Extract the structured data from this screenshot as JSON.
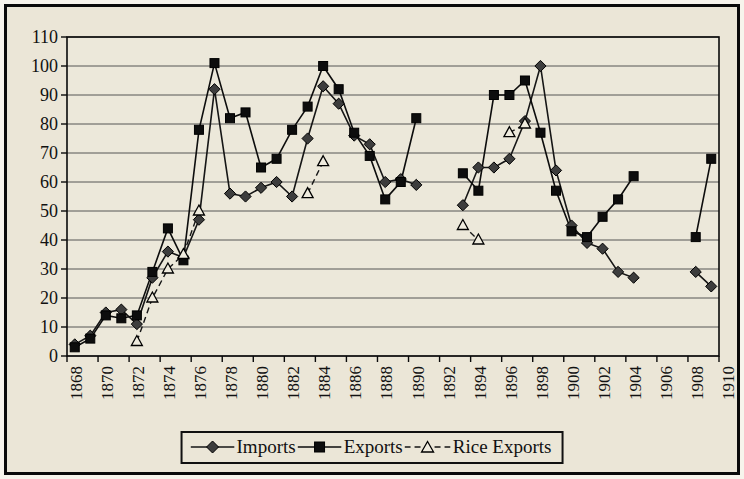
{
  "frame": {
    "page_background": "#f7f4ec",
    "paper_background": "#ebe6d7",
    "border_color": "#0a0a0a"
  },
  "chart_data": {
    "type": "line",
    "title": "",
    "xlabel": "",
    "ylabel": "",
    "ylim": [
      0,
      110
    ],
    "yticks": [
      0,
      10,
      20,
      30,
      40,
      50,
      60,
      70,
      80,
      90,
      100,
      110
    ],
    "xtick_labels": [
      "1868",
      "1870",
      "1872",
      "1874",
      "1876",
      "1878",
      "1880",
      "1882",
      "1884",
      "1886",
      "1888",
      "1890",
      "1892",
      "1894",
      "1896",
      "1898",
      "1900",
      "1902",
      "1904",
      "1906",
      "1908",
      "1910"
    ],
    "years": [
      1868,
      1869,
      1870,
      1871,
      1872,
      1873,
      1874,
      1875,
      1876,
      1877,
      1878,
      1879,
      1880,
      1881,
      1882,
      1883,
      1884,
      1885,
      1886,
      1887,
      1888,
      1889,
      1890,
      1891,
      1892,
      1893,
      1894,
      1895,
      1896,
      1897,
      1898,
      1899,
      1900,
      1901,
      1902,
      1903,
      1904,
      1905,
      1906,
      1907,
      1908,
      1909,
      1910
    ],
    "grid": "horizontal",
    "legend_position": "bottom",
    "plot": {
      "bg": "#ece8da",
      "grid_color": "#454545",
      "axis_color": "#0a0a0a",
      "tick_font_px": 18
    },
    "series": [
      {
        "name": "Imports",
        "marker": "diamond",
        "line_style": "solid",
        "color": "#161616",
        "marker_fill": "#3d3d3d",
        "values": [
          4,
          7,
          15,
          16,
          11,
          27,
          36,
          34,
          47,
          92,
          56,
          55,
          58,
          60,
          55,
          75,
          93,
          87,
          76,
          73,
          60,
          61,
          59,
          null,
          null,
          52,
          65,
          65,
          68,
          81,
          100,
          64,
          45,
          39,
          37,
          29,
          27,
          null,
          null,
          null,
          29,
          24,
          null
        ]
      },
      {
        "name": "Exports",
        "marker": "square",
        "line_style": "solid",
        "color": "#0d0d0d",
        "marker_fill": "#0d0d0d",
        "values": [
          3,
          6,
          14,
          13,
          14,
          29,
          44,
          33,
          78,
          101,
          82,
          84,
          65,
          68,
          78,
          86,
          100,
          92,
          77,
          69,
          54,
          60,
          82,
          null,
          null,
          63,
          57,
          90,
          90,
          95,
          77,
          57,
          43,
          41,
          48,
          54,
          62,
          null,
          null,
          null,
          41,
          68,
          null
        ]
      },
      {
        "name": "Rice Exports",
        "marker": "triangle-open",
        "line_style": "dashed",
        "color": "#161616",
        "marker_fill": "#efebde",
        "values": [
          null,
          null,
          null,
          null,
          5,
          20,
          30,
          35,
          50,
          null,
          null,
          null,
          null,
          null,
          null,
          56,
          67,
          null,
          null,
          null,
          null,
          null,
          null,
          null,
          null,
          45,
          40,
          null,
          77,
          80,
          null,
          null,
          null,
          null,
          null,
          null,
          null,
          null,
          null,
          null,
          null,
          null,
          null
        ]
      }
    ]
  }
}
